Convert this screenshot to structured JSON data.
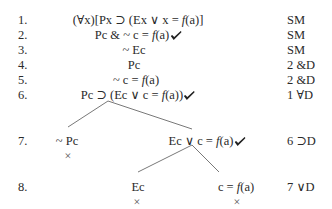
{
  "rows": [
    {
      "num": "1.",
      "formula_pre": "(∀x)[Px ⊃ (Ex ∨ x = ",
      "fn": "f",
      "formula_post": "(a)]",
      "checked": false,
      "just": "SM"
    },
    {
      "num": "2.",
      "formula_pre": "Pc & ~ c = ",
      "fn": "f",
      "formula_post": "(a)",
      "checked": true,
      "just": "SM"
    },
    {
      "num": "3.",
      "formula_pre": "~ Ec",
      "fn": "",
      "formula_post": "",
      "checked": false,
      "just": "SM"
    },
    {
      "num": "4.",
      "formula_pre": "Pc",
      "fn": "",
      "formula_post": "",
      "checked": false,
      "just": "2 &D"
    },
    {
      "num": "5.",
      "formula_pre": "~ c = ",
      "fn": "f",
      "formula_post": "(a)",
      "checked": false,
      "just": "2 &D"
    },
    {
      "num": "6.",
      "formula_pre": "Pc ⊃ (Ec ∨ c = ",
      "fn": "f",
      "formula_post": "(a))",
      "checked": true,
      "just": "1 ∀D"
    },
    {
      "num": "7.",
      "just": "6 ⊃D",
      "left": {
        "formula": "~ Pc",
        "closed": true
      },
      "right": {
        "formula_pre": "Ec ∨ c = ",
        "fn": "f",
        "formula_post": "(a)",
        "checked": true
      }
    },
    {
      "num": "8.",
      "just": "7 ∨D",
      "left": {
        "formula": "Ec",
        "closed": true
      },
      "right": {
        "formula_pre": "c = ",
        "fn": "f",
        "formula_post": "(a)",
        "closed": true
      }
    }
  ],
  "symbols": {
    "closed_mark": "×"
  }
}
